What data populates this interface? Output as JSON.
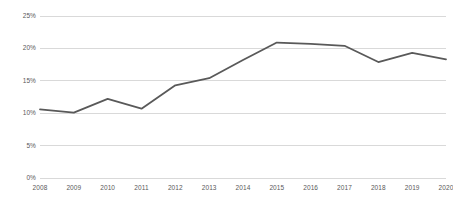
{
  "chart_data": {
    "type": "line",
    "title": "",
    "subtitle": "",
    "xlabel": "",
    "ylabel": "",
    "categories": [
      "2008",
      "2009",
      "2010",
      "2011",
      "2012",
      "2013",
      "2014",
      "2015",
      "2016",
      "2017",
      "2018",
      "2019",
      "2020"
    ],
    "values": [
      10.6,
      10.1,
      12.2,
      10.7,
      14.3,
      15.4,
      18.2,
      20.9,
      20.7,
      20.4,
      17.9,
      19.3,
      18.3
    ],
    "series": [
      {
        "name": "",
        "values": [
          10.6,
          10.1,
          12.2,
          10.7,
          14.3,
          15.4,
          18.2,
          20.9,
          20.7,
          20.4,
          17.9,
          19.3,
          18.3
        ]
      }
    ],
    "y_tick_labels": [
      "0%",
      "5%",
      "10%",
      "15%",
      "20%",
      "25%"
    ],
    "y_tick_values": [
      0,
      5,
      10,
      15,
      20,
      25
    ],
    "ylim": [
      0,
      25
    ],
    "grid": true,
    "grid_axis": "y",
    "legend": false,
    "legend_position": "none",
    "annotations": [],
    "colors": {
      "line": "#595959",
      "grid": "#d9d9d9",
      "axis_text": "#595959",
      "background": "#ffffff"
    },
    "line_width": 1.8,
    "markers": false,
    "value_suffix": "%"
  }
}
